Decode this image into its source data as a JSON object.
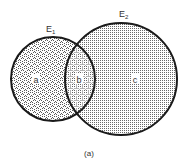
{
  "diagram": {
    "type": "venn",
    "caption": "(a)",
    "sets": [
      {
        "name": "E1",
        "label_main": "E",
        "label_sub": "1",
        "cx": 53,
        "cy": 79,
        "r": 42
      },
      {
        "name": "E2",
        "label_main": "E",
        "label_sub": "2",
        "cx": 121,
        "cy": 79,
        "r": 56
      }
    ],
    "regions": [
      {
        "id": "a",
        "label": "a",
        "description": "E1 only"
      },
      {
        "id": "b",
        "label": "b",
        "description": "E1 ∩ E2"
      },
      {
        "id": "c",
        "label": "c",
        "description": "E2 only"
      }
    ],
    "colors": {
      "stroke": "#1a1a1a",
      "fill_dots": "#555555",
      "background": "#ffffff"
    }
  }
}
